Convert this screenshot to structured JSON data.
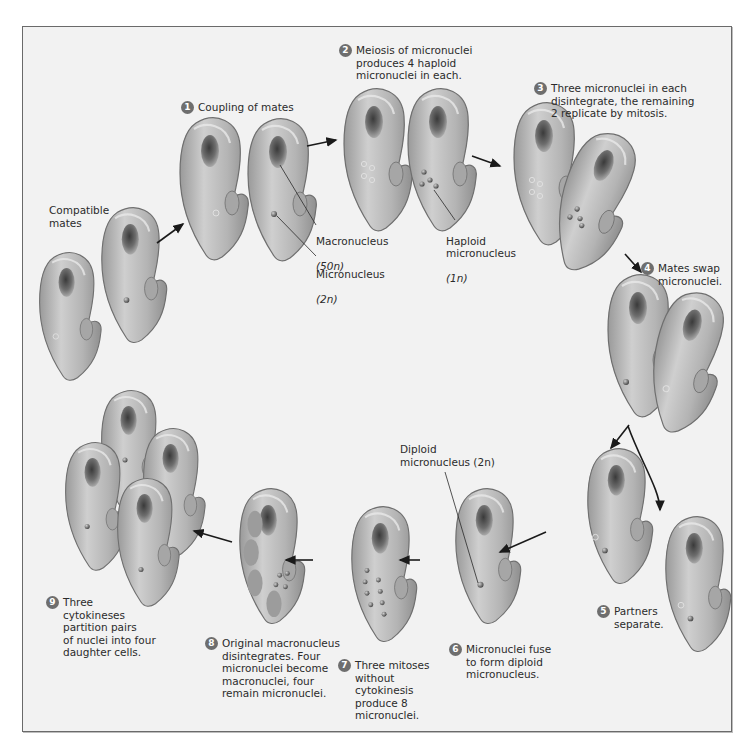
{
  "figure": {
    "colors": {
      "background": "#f2f2f2",
      "frame_border": "#6a6a6a",
      "cell_fill": "#b8b8b8",
      "cell_outline": "#6f6f6f",
      "nucleus": "#5a5a5a",
      "step_badge": "#6e6e6e",
      "text": "#2b2b2b",
      "arrow": "#1a1a1a"
    }
  },
  "labels": {
    "compatible_mates": "Compatible\nmates",
    "macronucleus": "Macronucleus",
    "macronucleus_ploidy": "(50n)",
    "micronucleus": "Micronucleus",
    "micronucleus_ploidy": "(2n)",
    "haploid_micronucleus": "Haploid\nmicronucleus",
    "haploid_ploidy": "(1n)",
    "diploid_micronucleus": "Diploid\nmicronucleus (2n)"
  },
  "steps": [
    {
      "number": "1",
      "text": "Coupling of mates"
    },
    {
      "number": "2",
      "text": "Meiosis of micronuclei\nproduces 4 haploid\nmicronuclei in each."
    },
    {
      "number": "3",
      "text": "Three micronuclei in each\ndisintegrate, the remaining\n2 replicate by mitosis."
    },
    {
      "number": "4",
      "text": "Mates swap\nmicronuclei."
    },
    {
      "number": "5",
      "text": "Partners\nseparate."
    },
    {
      "number": "6",
      "text": "Micronuclei fuse\nto form diploid\nmicronucleus."
    },
    {
      "number": "7",
      "text": "Three mitoses\nwithout\ncytokinesis\nproduce 8\nmicronuclei."
    },
    {
      "number": "8",
      "text": "Original macronucleus\ndisintegrates. Four\nmicronuclei become\nmacronuclei, four\nremain micronuclei."
    },
    {
      "number": "9",
      "text": "Three\ncytokineses\npartition pairs\nof nuclei into four\ndaughter cells."
    }
  ]
}
